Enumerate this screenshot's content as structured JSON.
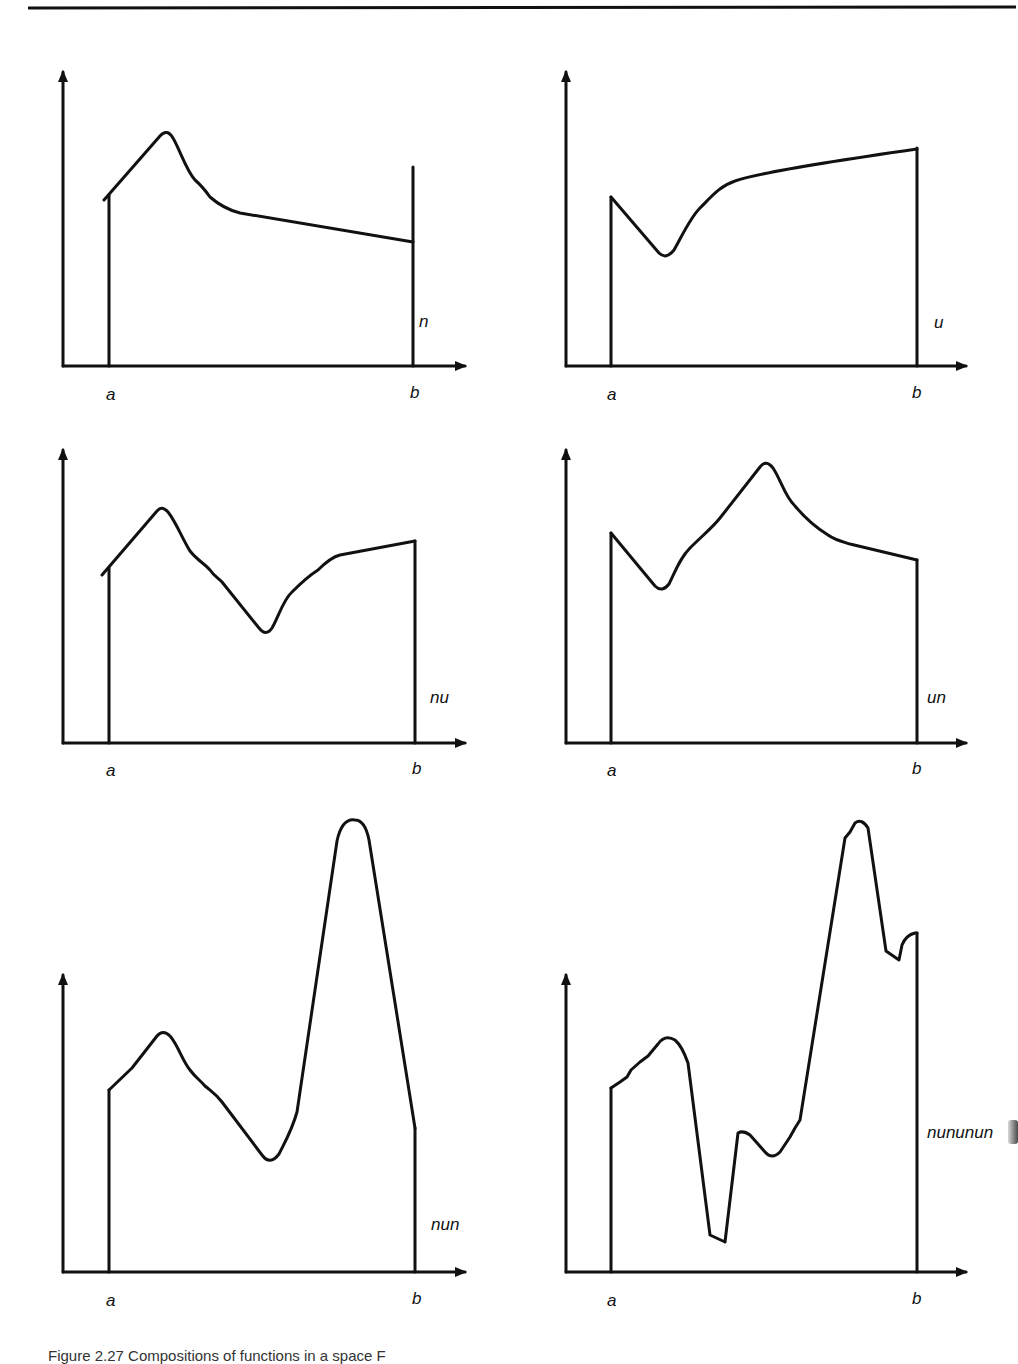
{
  "figure": {
    "caption": "Figure 2.27 Compositions of functions in a space F",
    "stroke_color": "#111111",
    "background": "#ffffff",
    "panels": [
      {
        "id": "n",
        "function_label": "n",
        "x_start_label": "a",
        "x_end_label": "b",
        "description": "Single peak near a, then gently decreasing line to b"
      },
      {
        "id": "u",
        "function_label": "u",
        "x_start_label": "a",
        "x_end_label": "b",
        "description": "Single dip near a, then rising curve to b"
      },
      {
        "id": "nu",
        "function_label": "nu",
        "x_start_label": "a",
        "x_end_label": "b",
        "description": "Peak then dip then rising to b"
      },
      {
        "id": "un",
        "function_label": "un",
        "x_start_label": "a",
        "x_end_label": "b",
        "description": "Dip then central peak then decreasing to b"
      },
      {
        "id": "nun",
        "function_label": "nun",
        "x_start_label": "a",
        "x_end_label": "b",
        "description": "Peak, dip, tall peak, then falling to b"
      },
      {
        "id": "nununun",
        "function_label": "nununun",
        "x_start_label": "a",
        "x_end_label": "b",
        "description": "Peak, deep dip, small peak, dip, tall peak, dip, small rise at b"
      }
    ]
  }
}
